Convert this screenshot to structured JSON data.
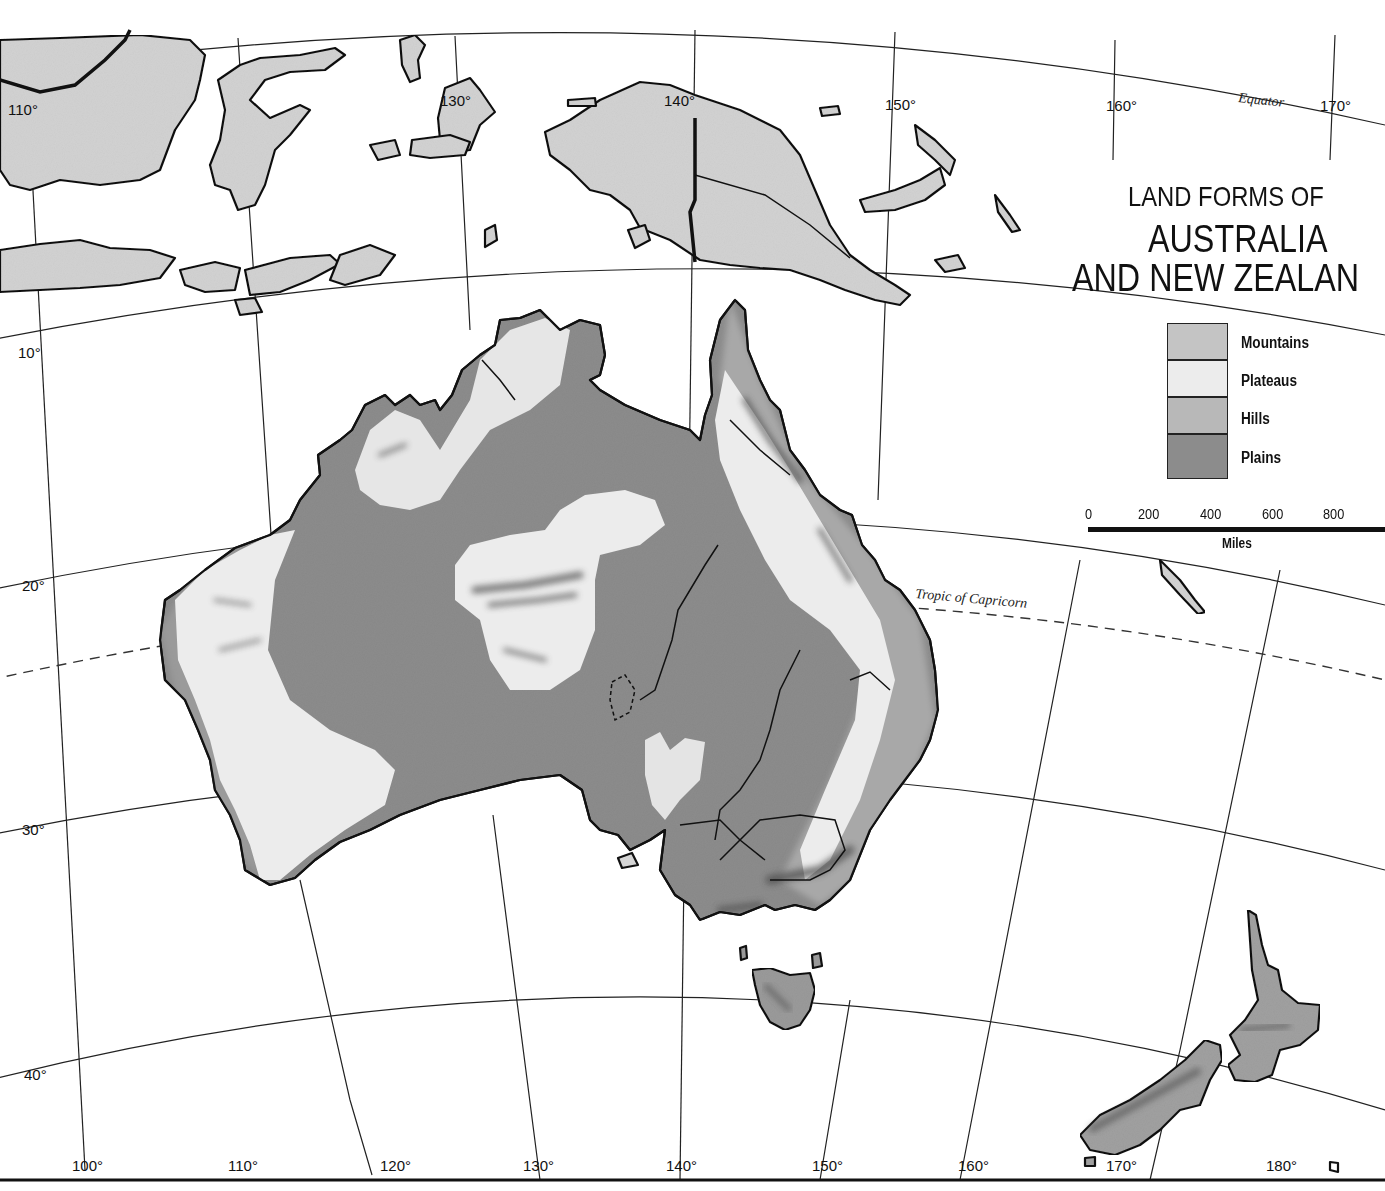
{
  "map": {
    "title_line1": "LAND FORMS OF",
    "title_line2": "AUSTRALIA",
    "title_line3": "AND NEW ZEALAN",
    "legend": [
      {
        "label": "Mountains",
        "color": "#c4c4c4"
      },
      {
        "label": "Plateaus",
        "color": "#ececec"
      },
      {
        "label": "Hills",
        "color": "#b8b8b8"
      },
      {
        "label": "Plains",
        "color": "#8c8c8c"
      }
    ],
    "scale": {
      "ticks": [
        "0",
        "200",
        "400",
        "600",
        "800"
      ],
      "unit": "Miles"
    },
    "lines": {
      "equator": "Equator",
      "tropic": "Tropic of Capricorn"
    },
    "longitude_top": [
      "110°",
      "130°",
      "140°",
      "150°",
      "160°",
      "170°"
    ],
    "longitude_bottom": [
      "100°",
      "110°",
      "120°",
      "130°",
      "140°",
      "150°",
      "160°",
      "170°",
      "180°"
    ],
    "latitude": [
      "10°",
      "20°",
      "30°",
      "40°"
    ],
    "colors": {
      "land_north": "#d2d2d2",
      "plains": "#8c8c8c",
      "plateaus": "#ececec",
      "hills": "#b0b0b0",
      "mountains_shade": "#4a4a4a",
      "ocean": "#ffffff"
    }
  }
}
